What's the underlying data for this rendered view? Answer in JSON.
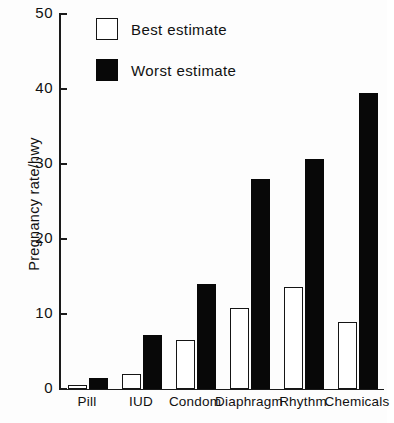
{
  "chart_data": {
    "type": "bar",
    "title": "",
    "xlabel": "",
    "ylabel": "Pregnancy rate/hwy",
    "ylim": [
      0,
      50
    ],
    "yticks": [
      0,
      10,
      20,
      30,
      40,
      50
    ],
    "ytick_labels": [
      "0",
      "10",
      "20",
      "30",
      "40",
      "50"
    ],
    "grid": false,
    "legend_position": "top-left-inside",
    "categories": [
      "Pill",
      "IUD",
      "Condom",
      "Diaphragm",
      "Rhythm",
      "Chemicals"
    ],
    "series": [
      {
        "name": "Best estimate",
        "color": "#ffffff",
        "edge_color": "#151515",
        "values": [
          0.5,
          2.0,
          6.5,
          10.8,
          13.6,
          9.0
        ]
      },
      {
        "name": "Worst estimate",
        "color": "#080808",
        "edge_color": "#080808",
        "values": [
          1.5,
          7.2,
          14.0,
          28.0,
          30.7,
          39.5
        ]
      }
    ]
  },
  "legend": {
    "items": [
      {
        "label": "Best estimate",
        "swatch": "open-square"
      },
      {
        "label": "Worst estimate",
        "swatch": "filled-square"
      }
    ]
  },
  "axes": {
    "y_title": "Pregnancy rate/hwy"
  }
}
